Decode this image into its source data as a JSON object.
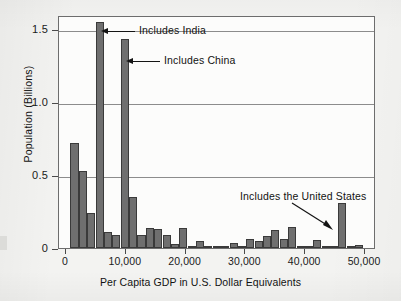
{
  "chart_data": {
    "type": "bar",
    "title": "",
    "subtitle": "",
    "xlabel": "Per Capita GDP in U.S. Dollar Equivalents",
    "ylabel": "Population (Billions)",
    "xlim": [
      0,
      51000
    ],
    "ylim": [
      0,
      1.62
    ],
    "grid": "horizontal",
    "legend": "none",
    "bin_width": 1500,
    "x_ticks": [
      {
        "value": 0,
        "label": "0"
      },
      {
        "value": 10000,
        "label": "10,000"
      },
      {
        "value": 20000,
        "label": "20,000"
      },
      {
        "value": 30000,
        "label": "30,000"
      },
      {
        "value": 40000,
        "label": "40,000"
      },
      {
        "value": 50000,
        "label": "50,000"
      }
    ],
    "y_ticks": [
      {
        "value": 0,
        "label": "0"
      },
      {
        "value": 0.5,
        "label": "0.5"
      },
      {
        "value": 1.0,
        "label": "1.0"
      },
      {
        "value": 1.5,
        "label": "1.5"
      }
    ],
    "bars": [
      {
        "x0": 750,
        "x1": 2100,
        "value": 0.72
      },
      {
        "x0": 2150,
        "x1": 3500,
        "value": 0.53
      },
      {
        "x0": 3550,
        "x1": 4900,
        "value": 0.24
      },
      {
        "x0": 4950,
        "x1": 6300,
        "value": 1.55
      },
      {
        "x0": 6350,
        "x1": 7700,
        "value": 0.11
      },
      {
        "x0": 7750,
        "x1": 9100,
        "value": 0.09
      },
      {
        "x0": 9150,
        "x1": 10500,
        "value": 1.43
      },
      {
        "x0": 10550,
        "x1": 11900,
        "value": 0.35
      },
      {
        "x0": 11950,
        "x1": 13300,
        "value": 0.09
      },
      {
        "x0": 13350,
        "x1": 14700,
        "value": 0.14
      },
      {
        "x0": 14750,
        "x1": 16100,
        "value": 0.13
      },
      {
        "x0": 16150,
        "x1": 17500,
        "value": 0.09
      },
      {
        "x0": 17550,
        "x1": 18900,
        "value": 0.03
      },
      {
        "x0": 18950,
        "x1": 20300,
        "value": 0.14
      },
      {
        "x0": 20350,
        "x1": 21700,
        "value": 0.015
      },
      {
        "x0": 21750,
        "x1": 23100,
        "value": 0.045
      },
      {
        "x0": 23150,
        "x1": 24500,
        "value": 0.004
      },
      {
        "x0": 24550,
        "x1": 25900,
        "value": 0.003
      },
      {
        "x0": 25950,
        "x1": 27300,
        "value": 0.012
      },
      {
        "x0": 27350,
        "x1": 28700,
        "value": 0.035
      },
      {
        "x0": 28750,
        "x1": 30100,
        "value": 0.007
      },
      {
        "x0": 30150,
        "x1": 31500,
        "value": 0.06
      },
      {
        "x0": 31550,
        "x1": 32900,
        "value": 0.05
      },
      {
        "x0": 32950,
        "x1": 34300,
        "value": 0.085
      },
      {
        "x0": 34350,
        "x1": 35700,
        "value": 0.125
      },
      {
        "x0": 35750,
        "x1": 37100,
        "value": 0.065
      },
      {
        "x0": 37150,
        "x1": 38500,
        "value": 0.145
      },
      {
        "x0": 38550,
        "x1": 39900,
        "value": 0.015
      },
      {
        "x0": 39950,
        "x1": 41300,
        "value": 0.004
      },
      {
        "x0": 41350,
        "x1": 42700,
        "value": 0.055
      },
      {
        "x0": 42750,
        "x1": 44100,
        "value": 0.003
      },
      {
        "x0": 44150,
        "x1": 45500,
        "value": 0.008
      },
      {
        "x0": 45550,
        "x1": 46900,
        "value": 0.31
      },
      {
        "x0": 46950,
        "x1": 48300,
        "value": 0.004
      },
      {
        "x0": 48350,
        "x1": 49700,
        "value": 0.022
      }
    ],
    "annotations": [
      {
        "id": "india",
        "text": "Includes India",
        "points_to_value": 1.55,
        "arrow": "left"
      },
      {
        "id": "china",
        "text": "Includes China",
        "points_to_value": 1.43,
        "arrow": "left"
      },
      {
        "id": "united-states",
        "text": "Includes the United States",
        "points_to_value": 0.31,
        "arrow": "diagonal-down-right"
      }
    ],
    "colors": {
      "bar_fill": "#6f6f6f",
      "bar_edge": "#3a3a3a",
      "grid": "#8c8c8c",
      "frame": "#6d6d6d",
      "text": "#121212",
      "background": "#f3f3f1",
      "plot_background": "#fcfcfb"
    }
  }
}
